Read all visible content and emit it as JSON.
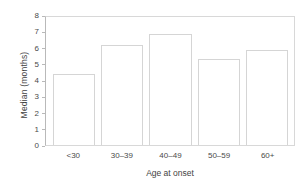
{
  "chart_data": {
    "type": "bar",
    "title": "",
    "subtitle": "",
    "xlabel": "Age at onset",
    "ylabel": "Median (months)",
    "categories": [
      "<30",
      "30–39",
      "40–49",
      "50–59",
      "60+"
    ],
    "values": [
      4.45,
      6.25,
      6.95,
      5.35,
      5.95
    ],
    "series": [
      {
        "name": "Median months",
        "values": [
          4.45,
          6.25,
          6.95,
          5.35,
          5.95
        ]
      }
    ],
    "ylim": [
      0,
      8
    ],
    "yticks": [
      0,
      1,
      2,
      3,
      4,
      5,
      6,
      7,
      8
    ],
    "ytick_labels": [
      "0",
      "1",
      "2",
      "3",
      "4",
      "5",
      "6",
      "7",
      "8"
    ],
    "grid": false,
    "legend": false,
    "legend_position": "none",
    "orientation": "vertical",
    "bar_fill_color": "#ffffff",
    "bar_edge_color": "#d5d5d5",
    "axis_color": "#b9b9b9",
    "text_color": "#3f3f3f",
    "background_color": "#ffffff"
  }
}
